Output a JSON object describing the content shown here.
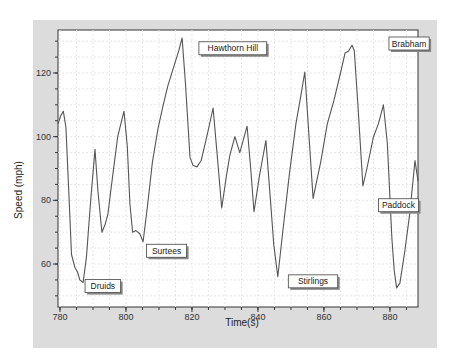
{
  "chart_data": {
    "type": "line",
    "title": "",
    "xlabel": "Time(s)",
    "ylabel": "Speed (mph)",
    "xlim": [
      779.4,
      888.5
    ],
    "ylim": [
      46.5,
      133.5
    ],
    "xticks": [
      780,
      800,
      820,
      840,
      860,
      880
    ],
    "yticks": [
      60,
      80,
      100,
      120
    ],
    "x_minor_step": 5,
    "y_minor_step": 5,
    "grid": true,
    "colors": {
      "frame": "#dcdcdc",
      "plot_bg": "#ffffff",
      "grid": "#e6e6e6",
      "line": "#555555",
      "axis": "#333333"
    },
    "series": [
      {
        "name": "Speed",
        "x": [
          779.4,
          780.2,
          781.0,
          781.8,
          782.6,
          783.5,
          784.5,
          785.3,
          786.0,
          787.0,
          788.0,
          789.3,
          790.6,
          791.5,
          792.7,
          793.7,
          794.5,
          796.0,
          797.5,
          799.4,
          800.4,
          801.2,
          802.0,
          803.0,
          804.2,
          805.2,
          806.5,
          808.0,
          809.7,
          811.2,
          812.7,
          814.5,
          816.0,
          817.0,
          818.0,
          819.4,
          820.3,
          821.5,
          822.8,
          824.5,
          826.4,
          827.5,
          829.0,
          830.5,
          831.5,
          833.0,
          834.5,
          836.7,
          837.8,
          838.8,
          840.5,
          842.4,
          843.5,
          844.8,
          846.0,
          847.5,
          849.5,
          851.5,
          853.0,
          854.2,
          855.3,
          856.7,
          857.8,
          859.0,
          861.0,
          863.0,
          865.0,
          866.4,
          867.4,
          868.5,
          869.2,
          870.3,
          871.8,
          873.0,
          875.0,
          876.5,
          878.0,
          879.2,
          880.6,
          881.3,
          882.0,
          883.0,
          884.5,
          886.0,
          887.6,
          888.5
        ],
        "values": [
          104,
          106.5,
          108,
          103,
          84,
          63,
          59,
          57.5,
          55,
          54.2,
          62,
          80,
          96,
          83,
          70,
          72.5,
          75.5,
          88,
          100,
          108,
          97,
          79,
          70,
          70.5,
          69.5,
          67,
          78,
          92,
          102.5,
          109.5,
          116,
          122,
          127,
          131,
          117,
          93.5,
          91,
          90.5,
          92.5,
          100,
          109,
          96,
          77.6,
          88,
          94.3,
          100,
          95,
          103.3,
          90,
          76.4,
          88,
          98.8,
          84,
          66,
          56,
          70,
          88,
          104,
          113,
          120.3,
          103,
          80.6,
          86,
          92,
          104,
          111.3,
          120,
          126.3,
          126.8,
          128.7,
          127,
          110,
          84.5,
          90,
          100,
          104,
          110,
          98,
          68,
          58,
          52.5,
          54,
          64,
          76,
          92.5,
          86
        ]
      }
    ],
    "annotations": [
      {
        "text": "Druids",
        "x": 787.6,
        "y": 55.1
      },
      {
        "text": "Surtees",
        "x": 806.2,
        "y": 66.2
      },
      {
        "text": "Hawthorn Hill",
        "x": 822.1,
        "y": 129.8
      },
      {
        "text": "Stirlings",
        "x": 849.2,
        "y": 56.6
      },
      {
        "text": "Paddock",
        "x": 876.5,
        "y": 80.5
      },
      {
        "text": "Brabham",
        "x": 879.7,
        "y": 131.3
      }
    ]
  }
}
